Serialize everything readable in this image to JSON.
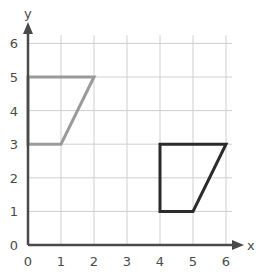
{
  "diagram": {
    "type": "coordinate-grid",
    "x_axis": {
      "label": "x",
      "ticks": [
        "0",
        "1",
        "2",
        "3",
        "4",
        "5",
        "6"
      ],
      "range": [
        0,
        6
      ]
    },
    "y_axis": {
      "label": "y",
      "ticks": [
        "0",
        "1",
        "2",
        "3",
        "4",
        "5",
        "6"
      ],
      "range": [
        0,
        6
      ]
    },
    "grid": true,
    "colors": {
      "grid": "#cfcfcf",
      "axis": "#4a4a4a",
      "shape_a": "#9a9a9a",
      "shape_b": "#2b2b2b"
    },
    "shapes": [
      {
        "name": "gray-trapezium",
        "color": "#9a9a9a",
        "vertices": [
          [
            0,
            5
          ],
          [
            2,
            5
          ],
          [
            1,
            3
          ],
          [
            0,
            3
          ]
        ]
      },
      {
        "name": "black-trapezium",
        "color": "#2b2b2b",
        "vertices": [
          [
            4,
            3
          ],
          [
            6,
            3
          ],
          [
            5,
            1
          ],
          [
            4,
            1
          ]
        ]
      }
    ]
  }
}
